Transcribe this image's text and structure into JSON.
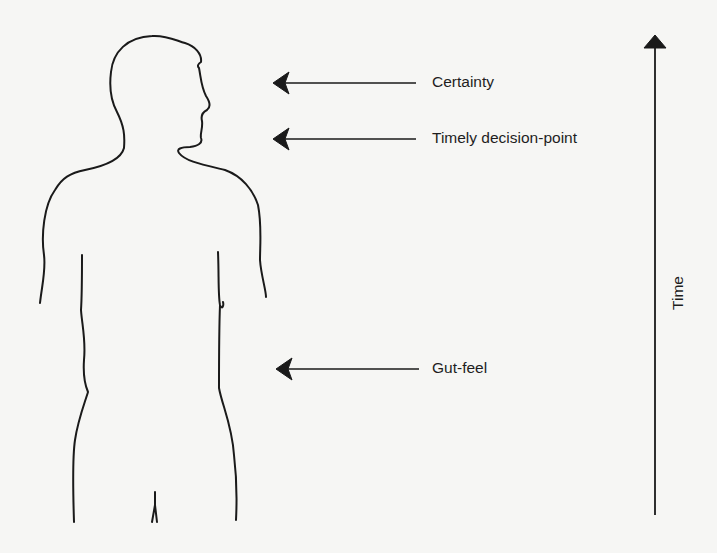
{
  "diagram": {
    "markers": [
      {
        "id": "certainty",
        "label": "Certainty"
      },
      {
        "id": "timely-decision-point",
        "label": "Timely decision-point"
      },
      {
        "id": "gut-feel",
        "label": "Gut-feel"
      }
    ],
    "axis": {
      "label": "Time",
      "direction": "up"
    },
    "colors": {
      "ink": "#1a1a1a",
      "background": "#f6f6f4"
    }
  }
}
